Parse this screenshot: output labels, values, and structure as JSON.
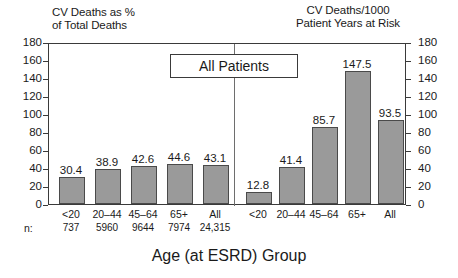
{
  "figure": {
    "callout_label": "All Patients",
    "x_axis_title": "Age (at ESRD) Group",
    "n_prefix": "n:"
  },
  "chart_data": {
    "type": "bar",
    "title": "All Patients",
    "xlabel": "Age (at ESRD) Group",
    "categories": [
      "<20",
      "20–44",
      "45–64",
      "65+",
      "All"
    ],
    "n": [
      "737",
      "5960",
      "9644",
      "7974",
      "24,315"
    ],
    "ylim": [
      0,
      180
    ],
    "yticks": [
      0,
      20,
      40,
      60,
      80,
      100,
      120,
      140,
      160,
      180
    ],
    "ytick_labels": [
      "0",
      "20",
      "40",
      "60",
      "80",
      "100",
      "120",
      "140",
      "160",
      "180"
    ],
    "grid": false,
    "legend": "none",
    "panels": [
      {
        "id": "left",
        "ylabel": "CV Deaths as %\nof Total Deaths",
        "axis_side": "left",
        "values": [
          30.4,
          38.9,
          42.6,
          44.6,
          43.1
        ],
        "value_labels": [
          "30.4",
          "38.9",
          "42.6",
          "44.6",
          "43.1"
        ]
      },
      {
        "id": "right",
        "ylabel": "CV Deaths/1000\nPatient Years at Risk",
        "axis_side": "right",
        "values": [
          12.8,
          41.4,
          85.7,
          147.5,
          93.5
        ],
        "value_labels": [
          "12.8",
          "41.4",
          "85.7",
          "147.5",
          "93.5"
        ]
      }
    ]
  },
  "colors": {
    "bar_fill": "#9a9a9a",
    "bar_edge": "#4a4a4a",
    "axis": "#3a3a3a",
    "text": "#1a1a1a"
  }
}
